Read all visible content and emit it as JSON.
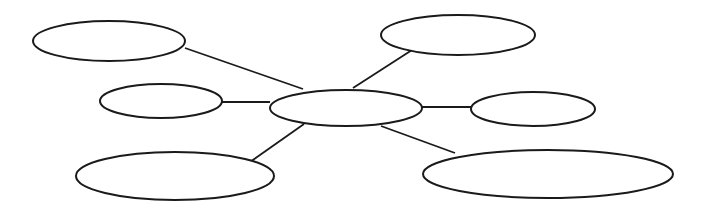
{
  "diagram": {
    "type": "spider-map",
    "colors": {
      "stroke": "#1a1a1a",
      "background": "#ffffff"
    },
    "center": {
      "id": "center",
      "label": "",
      "cx": 346,
      "cy": 108,
      "rx": 76,
      "ry": 18
    },
    "branches": [
      {
        "id": "top-left",
        "label": "",
        "cx": 109,
        "cy": 41,
        "rx": 76,
        "ry": 20,
        "edge": [
          185,
          48,
          303,
          89
        ]
      },
      {
        "id": "middle-left",
        "label": "",
        "cx": 161,
        "cy": 101,
        "rx": 61,
        "ry": 17,
        "edge": [
          222,
          102,
          270,
          102
        ]
      },
      {
        "id": "bottom-left",
        "label": "",
        "cx": 175,
        "cy": 176,
        "rx": 99,
        "ry": 24,
        "edge": [
          250,
          162,
          304,
          124
        ]
      },
      {
        "id": "top-right",
        "label": "",
        "cx": 458,
        "cy": 35,
        "rx": 77,
        "ry": 20,
        "edge": [
          412,
          50,
          353,
          88
        ]
      },
      {
        "id": "middle-right",
        "label": "",
        "cx": 533,
        "cy": 109,
        "rx": 62,
        "ry": 17,
        "edge": [
          421,
          107,
          471,
          107
        ]
      },
      {
        "id": "bottom-right",
        "label": "",
        "cx": 548,
        "cy": 174,
        "rx": 125,
        "ry": 24,
        "edge": [
          455,
          153,
          381,
          126
        ]
      }
    ]
  }
}
